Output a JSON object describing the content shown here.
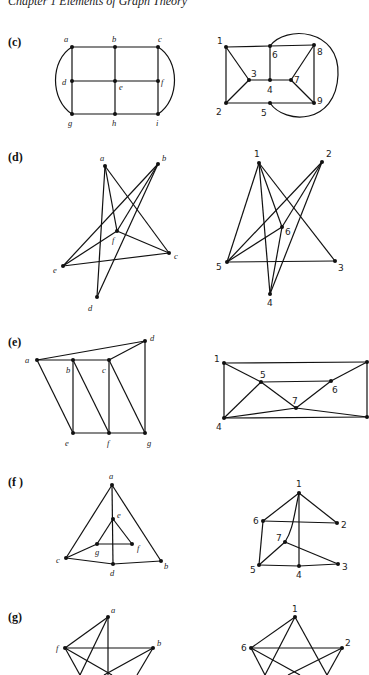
{
  "header": {
    "text": "Chapter 1   Elements of Graph Theory"
  },
  "sections": [
    {
      "id": "c",
      "label": "(c)"
    },
    {
      "id": "d",
      "label": "(d)"
    },
    {
      "id": "e",
      "label": "(e)"
    },
    {
      "id": "f",
      "label": "(f )"
    },
    {
      "id": "g",
      "label": "(g)"
    }
  ],
  "graphs": {
    "c_left": {
      "nodes": {
        "a": "a",
        "b": "b",
        "c": "c",
        "d": "d",
        "e": "e",
        "f": "f",
        "g": "g",
        "h": "h",
        "i": "i"
      },
      "edges": [
        "a-b",
        "b-c",
        "d-e",
        "e-f",
        "g-h",
        "h-i",
        "a-d",
        "d-g",
        "b-e",
        "e-h",
        "c-f",
        "f-i",
        "a-g (curved)",
        "c-i (curved)"
      ]
    },
    "c_right": {
      "nodes": {
        "n1": "1",
        "n2": "2",
        "n3": "3",
        "n4": "4",
        "n5": "5",
        "n6": "6",
        "n7": "7",
        "n8": "8",
        "n9": "9"
      },
      "edges": [
        "1-6",
        "6-8",
        "1-2",
        "1-3",
        "3-2",
        "3-4",
        "6-4",
        "4-7",
        "7-8",
        "7-9",
        "8-9",
        "2-5",
        "5-9",
        "6-5 (curved)"
      ]
    },
    "d_left": {
      "nodes": {
        "a": "a",
        "b": "b",
        "c": "c",
        "d": "d",
        "e": "e",
        "f": "f"
      },
      "edges": [
        "a-d",
        "a-f",
        "a-c",
        "b-e",
        "b-f",
        "b-d",
        "f-e",
        "f-c",
        "e-c"
      ]
    },
    "d_right": {
      "nodes": {
        "n1": "1",
        "n2": "2",
        "n3": "3",
        "n4": "4",
        "n5": "5",
        "n6": "6"
      },
      "edges": [
        "1-5",
        "1-4",
        "1-6",
        "1-3",
        "2-5",
        "2-6",
        "2-4",
        "6-5",
        "6-4",
        "5-3"
      ]
    },
    "e_left": {
      "nodes": {
        "a": "a",
        "b": "b",
        "c": "c",
        "d": "d",
        "e": "e",
        "f": "f",
        "g": "g"
      },
      "edges": [
        "a-d",
        "a-b",
        "b-c",
        "c-d",
        "a-e",
        "b-e",
        "b-f",
        "c-f",
        "c-g",
        "d-g",
        "e-f",
        "f-g"
      ]
    },
    "e_right": {
      "nodes": {
        "n1": "1",
        "n4": "4",
        "n5": "5",
        "n6": "6",
        "n7": "7"
      },
      "edges": [
        "1-TR",
        "1-4",
        "1-5",
        "5-6",
        "5-7",
        "5-4",
        "6-TR",
        "6-7",
        "7-4",
        "7-BR",
        "4-BR",
        "TR-BR"
      ]
    },
    "f_left": {
      "nodes": {
        "a": "a",
        "b": "b",
        "c": "c",
        "d": "d",
        "e": "e",
        "f": "f",
        "g": "g"
      },
      "edges": [
        "a-c",
        "a-b",
        "a-e",
        "e-d",
        "e-g",
        "e-f",
        "g-f",
        "g-c",
        "c-d",
        "d-b"
      ]
    },
    "f_right": {
      "nodes": {
        "n1": "1",
        "n2": "2",
        "n3": "3",
        "n4": "4",
        "n5": "5",
        "n6": "6",
        "n7": "7"
      },
      "edges": [
        "1-6",
        "1-2",
        "1-4",
        "1-7 (curved)",
        "6-2",
        "6-5",
        "7-5",
        "7-3",
        "5-4",
        "4-3"
      ]
    },
    "g_left": {
      "nodes": {
        "a": "a",
        "b": "b",
        "f": "f"
      },
      "edges": [
        "a-f",
        "f-b"
      ]
    },
    "g_right": {
      "nodes": {
        "n1": "1",
        "n2": "2",
        "n6": "6"
      },
      "edges": [
        "1-6",
        "6-2"
      ]
    }
  }
}
